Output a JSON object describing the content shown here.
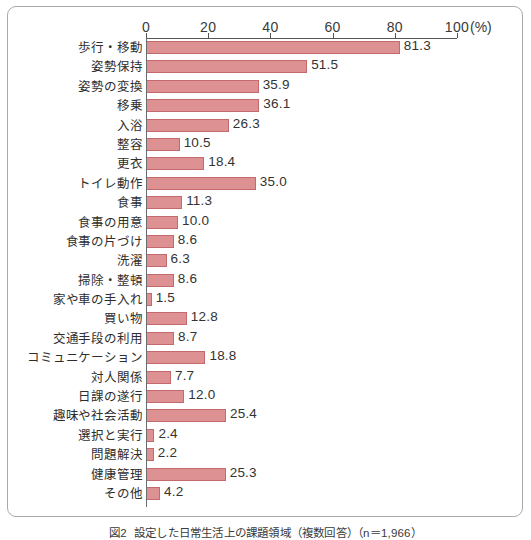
{
  "figure": {
    "caption_number": "図2",
    "caption_text": "設定した日常生活上の課題領域（複数回答）（n＝1,966）"
  },
  "axis": {
    "unit_label": "(%)",
    "tick_labels": [
      "0",
      "20",
      "40",
      "60",
      "80",
      "100"
    ]
  },
  "colors": {
    "bar_fill": "#de9193",
    "bar_border": "#c4696c",
    "axis": "#55565a",
    "frame": "#aaaaac",
    "text": "#333333"
  },
  "chart_data": {
    "type": "bar",
    "orientation": "horizontal",
    "title": "設定した日常生活上の課題領域（複数回答）（n＝1,966）",
    "xlabel": "(%)",
    "ylabel": "",
    "xlim": [
      0,
      100
    ],
    "xticks": [
      0,
      20,
      40,
      60,
      80,
      100
    ],
    "grid": false,
    "legend": "none",
    "categories": [
      "歩行・移動",
      "姿勢保持",
      "姿勢の変換",
      "移乗",
      "入浴",
      "整容",
      "更衣",
      "トイレ動作",
      "食事",
      "食事の用意",
      "食事の片づけ",
      "洗濯",
      "掃除・整頓",
      "家や車の手入れ",
      "買い物",
      "交通手段の利用",
      "コミュニケーション",
      "対人関係",
      "日課の遂行",
      "趣味や社会活動",
      "選択と実行",
      "問題解決",
      "健康管理",
      "その他"
    ],
    "values": [
      81.3,
      51.5,
      35.9,
      36.1,
      26.3,
      10.5,
      18.4,
      35.0,
      11.3,
      10.0,
      8.6,
      6.3,
      8.6,
      1.5,
      12.8,
      8.7,
      18.8,
      7.7,
      12.0,
      25.4,
      2.4,
      2.2,
      25.3,
      4.2
    ],
    "value_labels": [
      "81.3",
      "51.5",
      "35.9",
      "36.1",
      "26.3",
      "10.5",
      "18.4",
      "35.0",
      "11.3",
      "10.0",
      "8.6",
      "6.3",
      "8.6",
      "1.5",
      "12.8",
      "8.7",
      "18.8",
      "7.7",
      "12.0",
      "25.4",
      "2.4",
      "2.2",
      "25.3",
      "4.2"
    ]
  }
}
